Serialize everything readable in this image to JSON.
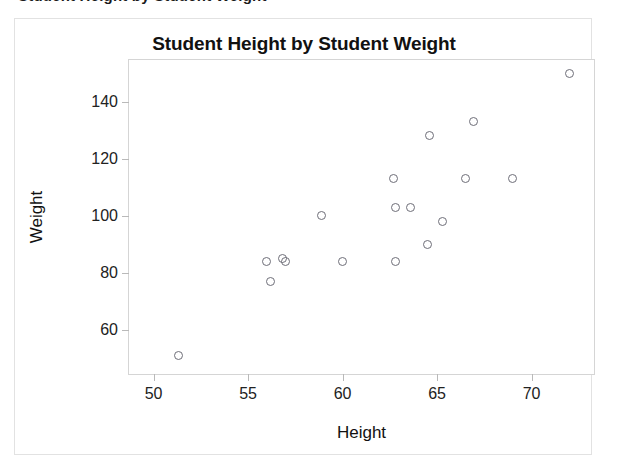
{
  "top_cropped_line": "Student Height by Student Weight",
  "figure": {
    "title": "Student Height by Student Weight",
    "background": "#ffffff",
    "border_color": "#e2e2e2"
  },
  "axes": {
    "x_title": "Height",
    "y_title": "Weight",
    "x_ticks": [
      "50",
      "55",
      "60",
      "65",
      "70"
    ],
    "y_ticks": [
      "60",
      "80",
      "100",
      "120",
      "140"
    ],
    "frame_color": "#d5d5d5",
    "tick_color": "#b9b9b9"
  },
  "marker": {
    "shape": "open-circle",
    "stroke_color": "#6e6e78",
    "fill": "none",
    "diameter_px": 9
  },
  "chart_data": {
    "type": "scatter",
    "title": "Student Height by Student Weight",
    "xlabel": "Height",
    "ylabel": "Weight",
    "xlim": [
      48.7,
      73.3
    ],
    "ylim": [
      44.6,
      154.6
    ],
    "xticks": [
      50,
      55,
      60,
      65,
      70
    ],
    "yticks": [
      60,
      80,
      100,
      120,
      140
    ],
    "grid": false,
    "legend": null,
    "series": [
      {
        "name": "students",
        "points": [
          {
            "x": 51.3,
            "y": 51
          },
          {
            "x": 56.0,
            "y": 84
          },
          {
            "x": 56.2,
            "y": 77
          },
          {
            "x": 56.8,
            "y": 85
          },
          {
            "x": 57.0,
            "y": 84
          },
          {
            "x": 58.9,
            "y": 100
          },
          {
            "x": 60.0,
            "y": 84
          },
          {
            "x": 62.7,
            "y": 113
          },
          {
            "x": 62.8,
            "y": 103
          },
          {
            "x": 62.8,
            "y": 84
          },
          {
            "x": 63.6,
            "y": 103
          },
          {
            "x": 64.5,
            "y": 90
          },
          {
            "x": 64.6,
            "y": 128
          },
          {
            "x": 65.3,
            "y": 98
          },
          {
            "x": 66.5,
            "y": 113
          },
          {
            "x": 66.9,
            "y": 133
          },
          {
            "x": 69.0,
            "y": 113
          },
          {
            "x": 72.0,
            "y": 150
          }
        ]
      }
    ]
  }
}
